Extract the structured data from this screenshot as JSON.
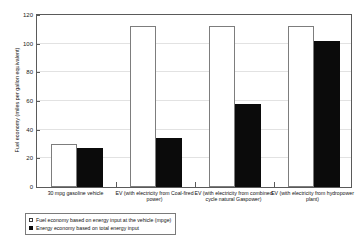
{
  "chart_data": {
    "type": "bar",
    "title": "",
    "xlabel": "",
    "ylabel": "Fuel economy (miles per gallon equivalent)",
    "ylim": [
      0,
      120
    ],
    "yticks": [
      0,
      20,
      40,
      60,
      80,
      100,
      120
    ],
    "grid": true,
    "legend_position": "below-plot-left",
    "categories": [
      "30 mpg gasoline vehicle",
      "EV (with electricity from Coal-fired power)",
      "EV (with electricity from combined cycle natural Gaspower)",
      "EV (with electricity from hydropower plant)"
    ],
    "series": [
      {
        "name": "Fuel economy based on energy input at the vehicle (mpge)",
        "marker": "hollow-square",
        "color": "#ffffff",
        "edge_color": "#7d7d7d",
        "values": [
          30,
          111,
          111,
          111
        ]
      },
      {
        "name": "Energy economy based on total energy input",
        "marker": "filled-square",
        "color": "#0b0b0b",
        "edge_color": "#0b0b0b",
        "values": [
          27,
          34,
          57,
          101
        ]
      }
    ]
  },
  "legend": {
    "items": [
      {
        "label": "Fuel economy based on energy input at the vehicle (mpge)"
      },
      {
        "label": "Energy economy based on total energy input"
      }
    ]
  }
}
